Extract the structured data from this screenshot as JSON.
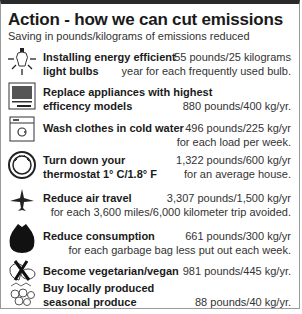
{
  "header": {
    "title": "Action - how we can cut emissions",
    "subtitle": "Saving in pounds/kilograms of emissions reduced"
  },
  "actions": [
    {
      "icon": "light-bulb-icon",
      "label_line1": "Installing energy efficient",
      "label_line2": "light bulbs",
      "value": "55 pounds/25 kilograms",
      "detail": "year for each frequently used bulb."
    },
    {
      "icon": "appliance-icon",
      "label_line1": "Replace appliances with highest",
      "label_line2": "efficency models",
      "value": "880 pounds/400 kg/yr.",
      "detail": ""
    },
    {
      "icon": "washing-machine-icon",
      "label_line1": "Wash clothes in cold water",
      "label_line2": "",
      "value": "496 pounds/225 kg/yr",
      "detail": "for each load per week."
    },
    {
      "icon": "thermostat-icon",
      "label_line1": "Turn down your",
      "label_line2": "thermostat 1° C/1.8° F",
      "value": "1,322 pounds/600 kg/yr",
      "detail": "for an average house."
    },
    {
      "icon": "airplane-icon",
      "label_line1": "Reduce air travel",
      "label_line2": "",
      "value": "3,307 pounds/1,500 kg/yr",
      "detail": "for each 3,600 miles/6,000 kilometer trip avoided."
    },
    {
      "icon": "garbage-bag-icon",
      "label_line1": "Reduce consumption",
      "label_line2": "",
      "value": "661 pounds/300 kg/yr",
      "detail": "for each garbage bag less put out each week."
    },
    {
      "icon": "no-meat-icon",
      "label_line1": "Become vegetarian/vegan",
      "label_line2": "",
      "value": "981 pounds/445 kg/yr.",
      "detail": ""
    },
    {
      "icon": "produce-icon",
      "label_line1": "Buy locally produced",
      "label_line2": "seasonal produce",
      "value": "88 pounds/40 kg/yr.",
      "detail": ""
    }
  ]
}
